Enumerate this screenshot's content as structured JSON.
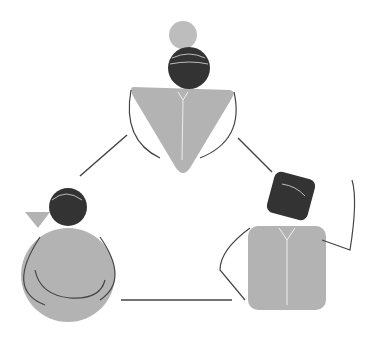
{
  "illustration": {
    "description": "Three abstract people shapes connected in a triangle",
    "colors": {
      "body": "#b3b3b3",
      "head": "#3a3a3a",
      "line": "#444444",
      "bun": "#bdbdbd",
      "background": "#ffffff"
    },
    "figures": [
      {
        "id": "top",
        "body_shape": "triangle",
        "head_shape": "circle"
      },
      {
        "id": "left",
        "body_shape": "circle",
        "head_shape": "circle"
      },
      {
        "id": "right",
        "body_shape": "square",
        "head_shape": "rounded-square"
      }
    ]
  }
}
